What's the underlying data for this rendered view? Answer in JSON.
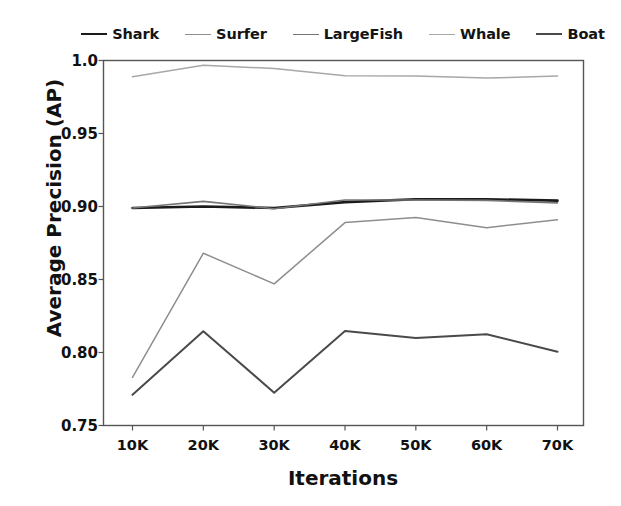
{
  "chart_data": {
    "type": "line",
    "title": "",
    "xlabel": "Iterations",
    "ylabel": "Average Precision (AP)",
    "categories": [
      "10K",
      "20K",
      "30K",
      "40K",
      "50K",
      "60K",
      "70K"
    ],
    "x_values": [
      10000,
      20000,
      30000,
      40000,
      50000,
      60000,
      70000
    ],
    "ylim": [
      0.75,
      1.0
    ],
    "y_ticks": [
      0.75,
      0.8,
      0.85,
      0.9,
      0.95,
      1.0
    ],
    "y_tick_labels": [
      "0.75",
      "0.80",
      "0.85",
      "0.90",
      "0.95",
      "1.0"
    ],
    "grid": false,
    "legend_position": "top",
    "series": [
      {
        "name": "Shark",
        "color": "#1b1b1b",
        "width": 2.6,
        "values": [
          0.899,
          0.9,
          0.899,
          0.903,
          0.905,
          0.905,
          0.904
        ]
      },
      {
        "name": "Surfer",
        "color": "#8e8e8e",
        "width": 1.5,
        "values": [
          0.783,
          0.868,
          0.847,
          0.889,
          0.8925,
          0.8855,
          0.891
        ]
      },
      {
        "name": "LargeFish",
        "color": "#767676",
        "width": 1.6,
        "values": [
          0.899,
          0.9035,
          0.8985,
          0.9045,
          0.9045,
          0.9042,
          0.9025
        ]
      },
      {
        "name": "Whale",
        "color": "#a8a8a8",
        "width": 1.5,
        "values": [
          0.9888,
          0.9968,
          0.9945,
          0.9895,
          0.9893,
          0.988,
          0.9893
        ]
      },
      {
        "name": "Boat",
        "color": "#4a4a4a",
        "width": 2.0,
        "values": [
          0.771,
          0.8145,
          0.7725,
          0.8148,
          0.81,
          0.8125,
          0.8005
        ]
      }
    ]
  },
  "legend": {
    "items": [
      {
        "label": "Shark"
      },
      {
        "label": "Surfer"
      },
      {
        "label": "LargeFish"
      },
      {
        "label": "Whale"
      },
      {
        "label": "Boat"
      }
    ]
  },
  "axes": {
    "frame_color": "#555555"
  }
}
